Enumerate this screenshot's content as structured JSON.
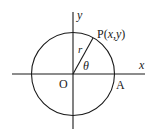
{
  "diagram": {
    "type": "unit-circle-polar",
    "labels": {
      "x_axis": "x",
      "y_axis": "y",
      "origin": "O",
      "point_a": "A",
      "point_p": "P(x,y)",
      "point_p_name": "P",
      "point_p_coords_open": "(",
      "point_p_x": "x",
      "point_p_comma": ",",
      "point_p_y": "y",
      "point_p_coords_close": ")",
      "radius": "r",
      "angle": "θ"
    },
    "colors": {
      "stroke": "#1a1a1a",
      "background": "#ffffff"
    }
  }
}
